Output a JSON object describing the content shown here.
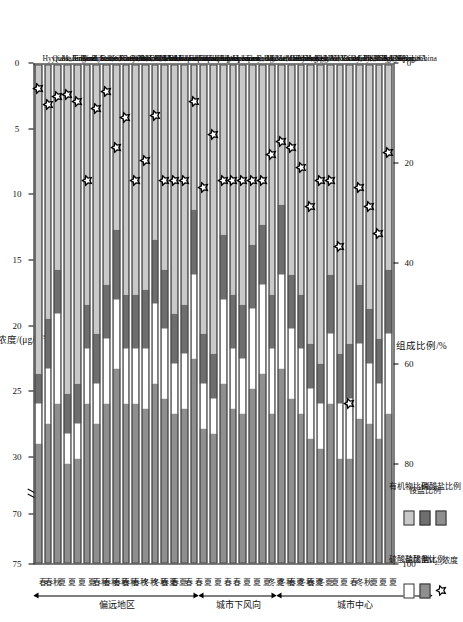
{
  "figure": {
    "top_axis_title": "PM2.5浓度/(μg/m3)",
    "top_axis_title_plain": "PM₂.₅浓度/(μg/m³)",
    "bottom_axis_title": "组成比例/%",
    "top_ticks": [
      "75",
      "70",
      "30",
      "25",
      "20",
      "15",
      "10",
      "5",
      "0"
    ],
    "bottom_ticks": [
      "100",
      "80",
      "60",
      "40",
      "20",
      "0"
    ],
    "axis_break_between": [
      "70",
      "30"
    ]
  },
  "legend": {
    "items": [
      {
        "key": "organics",
        "label": "有机物比例",
        "swatch": "sw-org",
        "color": "#c9c9c9"
      },
      {
        "key": "ammonium",
        "label": "铵盐比例",
        "swatch": "sw-amm",
        "color": "#6e6e6e"
      },
      {
        "key": "nitrate_b",
        "label": "硝酸盐比例",
        "swatch": "sw-nit2",
        "color": "#8f8f8f"
      },
      {
        "key": "sulfate",
        "label": "硫酸盐比例",
        "swatch": "sw-nit",
        "color": "#ffffff"
      },
      {
        "key": "nitrate",
        "label": "硝酸盐比例",
        "swatch": "sw-sul",
        "color": "#8f8f8f"
      },
      {
        "key": "pm25",
        "label": "PM2.5浓度",
        "swatch": "star",
        "color": "#000000"
      }
    ]
  },
  "groups": [
    {
      "label": "偏远地区",
      "start": 0,
      "end": 16
    },
    {
      "label": "城市下风向",
      "start": 17,
      "end": 24
    },
    {
      "label": "城市中心",
      "start": 25,
      "end": 40
    }
  ],
  "chart_data": {
    "type": "bar",
    "orientation": "horizontal-stacked",
    "title": "",
    "xlabel": "组成比例/%",
    "ylabel": "",
    "secondary_xlabel": "PM2.5浓度/(μg/m3)",
    "xlim": [
      0,
      100
    ],
    "secondary_xlim": [
      0,
      75
    ],
    "grid": false,
    "legend_position": "bottom-left",
    "series_names": [
      "有机物比例",
      "铵盐比例",
      "硝酸盐比例",
      "硫酸盐比例"
    ],
    "marker_series": "PM2.5浓度",
    "categories": [
      "Hyytiala, Finland",
      "Quest, Finland",
      "Mace Head, Ireland",
      "Jungfraujoch, Switzerland",
      "Nova Scotia, Canada",
      "Pinnacle State Park, NY, USA",
      "Duke Forest, NC, USA",
      "Storm Peak, CO, USA",
      "Cheju Island, Korea",
      "Okinawa Island, Japan",
      "Okinawa Island, Japan",
      "Okinawa Island, Japan",
      "Okinawa Island, Japan",
      "Okinawa Island, Japan",
      "Fukue Island, Japan",
      "Fukue Island, Japan",
      "Fukue Island, Japan",
      "Taunus, Germany",
      "Hohenpeissenberg, Germany",
      "Weybourne, UK",
      "London, UK",
      "East coast of USA, Leg2",
      "East coast of USA, Leg1",
      "Mainz, Germany",
      "Manchester, UK",
      "Manchester, UK",
      "Edinburgh, UK",
      "Vancouver, Canada",
      "New York City, USA",
      "New York City, USA",
      "Houston, TX, USA",
      "Riverside, CA, USA",
      "Mexico City, Mexico",
      "Pittsburgh, PA, USA",
      "Tokyo, Japan",
      "Tokyo, Japan",
      "Beijing, China"
    ],
    "seasons": [
      "春",
      "春秋",
      "夏",
      "夏",
      "夏",
      "夏",
      "春秋",
      "春秋",
      "春秋",
      "春秋",
      "春秋",
      "冬秋",
      "冬秋",
      "春夏",
      "春夏",
      "春",
      "春",
      "夏",
      "夏",
      "春",
      "春",
      "夏",
      "夏",
      "夏",
      "冬夏",
      "冬秋",
      "春夏",
      "冬秋",
      "春夏",
      "冬夏",
      "夏",
      "夏",
      "春",
      "冬秋",
      "夏",
      "夏",
      "夏"
    ],
    "series": [
      {
        "name": "有机物比例",
        "values": [
          62,
          51,
          41,
          66,
          64,
          48,
          54,
          44,
          33,
          46,
          46,
          45,
          35,
          41,
          50,
          48,
          29,
          54,
          58,
          34,
          46,
          48,
          36,
          32,
          46,
          28,
          42,
          46,
          56,
          60,
          42,
          58,
          56,
          44,
          49,
          55,
          41
        ]
      },
      {
        "name": "铵盐比例",
        "values": [
          6,
          10,
          9,
          8,
          8,
          9,
          10,
          11,
          14,
          11,
          11,
          12,
          13,
          12,
          10,
          10,
          13,
          10,
          9,
          13,
          11,
          11,
          13,
          12,
          11,
          14,
          11,
          11,
          9,
          8,
          12,
          10,
          11,
          12,
          11,
          9,
          13
        ]
      },
      {
        "name": "硝酸盐比例",
        "values": [
          8,
          11,
          18,
          6,
          7,
          11,
          8,
          13,
          14,
          11,
          11,
          12,
          16,
          14,
          10,
          11,
          17,
          9,
          7,
          17,
          12,
          11,
          16,
          18,
          13,
          19,
          14,
          13,
          10,
          9,
          14,
          11,
          12,
          15,
          12,
          11,
          16
        ]
      },
      {
        "name": "硫酸盐比例",
        "values": [
          24,
          28,
          32,
          20,
          21,
          32,
          28,
          32,
          39,
          32,
          32,
          31,
          36,
          33,
          30,
          31,
          41,
          27,
          26,
          36,
          31,
          30,
          35,
          38,
          30,
          39,
          33,
          30,
          25,
          23,
          32,
          21,
          21,
          29,
          28,
          25,
          30
        ]
      }
    ],
    "pm25_values": [
      2.0,
      3.2,
      2.6,
      2.4,
      3.0,
      9.0,
      3.5,
      2.2,
      6.5,
      4.2,
      9.0,
      7.5,
      4.0,
      9.0,
      9.0,
      9.0,
      3.0,
      9.5,
      5.5,
      9.0,
      9.0,
      9.0,
      9.0,
      9.0,
      7.0,
      6.0,
      6.5,
      8.0,
      11.0,
      9.0,
      9.0,
      14.0,
      26.0,
      9.5,
      11.0,
      13.0,
      34.0
    ]
  }
}
